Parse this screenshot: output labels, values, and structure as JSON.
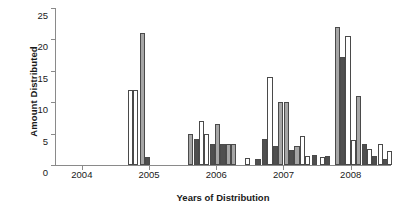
{
  "chart_data": {
    "type": "bar",
    "title": "",
    "subtitle": "",
    "xlabel": "Years of Distribution",
    "ylabel": "Amount Distributed",
    "grid": false,
    "legend": "none",
    "ylim": [
      0,
      25
    ],
    "yticks": [
      0,
      5,
      10,
      15,
      20,
      25
    ],
    "xlim": [
      2003.6,
      2008.6
    ],
    "xticks": [
      2004,
      2005,
      2006,
      2007,
      2008
    ],
    "xticklabels": [
      "2004",
      "2005",
      "2006",
      "2007",
      "2008"
    ],
    "series_colors": {
      "white": "#ffffff",
      "gray": "#a6a6a6",
      "dark": "#4f4f4f"
    },
    "bar_edge_color": "#4a4a4a",
    "axis_color": "#8a8a8a",
    "note": "Sequential bars along a time axis; fill shade varies per bar (white / gray / dark).",
    "bars": [
      {
        "x": 2004.72,
        "value": 12.0,
        "fill": "white"
      },
      {
        "x": 2004.8,
        "value": 12.0,
        "fill": "white"
      },
      {
        "x": 2004.9,
        "value": 21.0,
        "fill": "gray"
      },
      {
        "x": 2004.98,
        "value": 1.2,
        "fill": "dark"
      },
      {
        "x": 2005.62,
        "value": 5.0,
        "fill": "gray"
      },
      {
        "x": 2005.7,
        "value": 4.2,
        "fill": "dark"
      },
      {
        "x": 2005.78,
        "value": 7.0,
        "fill": "white"
      },
      {
        "x": 2005.86,
        "value": 5.0,
        "fill": "white"
      },
      {
        "x": 2005.94,
        "value": 3.4,
        "fill": "dark"
      },
      {
        "x": 2006.02,
        "value": 6.6,
        "fill": "gray"
      },
      {
        "x": 2006.1,
        "value": 3.4,
        "fill": "dark"
      },
      {
        "x": 2006.18,
        "value": 3.4,
        "fill": "gray"
      },
      {
        "x": 2006.26,
        "value": 3.3,
        "fill": "gray"
      },
      {
        "x": 2006.46,
        "value": 1.1,
        "fill": "white"
      },
      {
        "x": 2006.62,
        "value": 1.0,
        "fill": "dark"
      },
      {
        "x": 2006.72,
        "value": 4.2,
        "fill": "dark"
      },
      {
        "x": 2006.8,
        "value": 14.0,
        "fill": "white"
      },
      {
        "x": 2006.88,
        "value": 3.0,
        "fill": "dark"
      },
      {
        "x": 2006.96,
        "value": 10.0,
        "fill": "gray"
      },
      {
        "x": 2007.04,
        "value": 10.0,
        "fill": "gray"
      },
      {
        "x": 2007.12,
        "value": 2.4,
        "fill": "dark"
      },
      {
        "x": 2007.2,
        "value": 3.0,
        "fill": "gray"
      },
      {
        "x": 2007.28,
        "value": 4.6,
        "fill": "white"
      },
      {
        "x": 2007.36,
        "value": 1.4,
        "fill": "white"
      },
      {
        "x": 2007.46,
        "value": 1.6,
        "fill": "dark"
      },
      {
        "x": 2007.58,
        "value": 1.2,
        "fill": "white"
      },
      {
        "x": 2007.66,
        "value": 1.4,
        "fill": "dark"
      },
      {
        "x": 2007.8,
        "value": 22.0,
        "fill": "gray"
      },
      {
        "x": 2007.88,
        "value": 17.2,
        "fill": "dark"
      },
      {
        "x": 2007.96,
        "value": 20.5,
        "fill": "white"
      },
      {
        "x": 2008.04,
        "value": 4.0,
        "fill": "white"
      },
      {
        "x": 2008.12,
        "value": 11.0,
        "fill": "gray"
      },
      {
        "x": 2008.2,
        "value": 3.4,
        "fill": "dark"
      },
      {
        "x": 2008.28,
        "value": 2.6,
        "fill": "white"
      },
      {
        "x": 2008.36,
        "value": 1.4,
        "fill": "dark"
      },
      {
        "x": 2008.44,
        "value": 3.4,
        "fill": "white"
      },
      {
        "x": 2008.52,
        "value": 1.0,
        "fill": "dark"
      },
      {
        "x": 2008.58,
        "value": 2.2,
        "fill": "white"
      }
    ]
  }
}
